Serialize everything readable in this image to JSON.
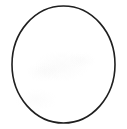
{
  "figure": {
    "caption": "A single thin dark circle outline centered on a plain white background",
    "background_color": "#ffffff",
    "canvas": {
      "width": 127,
      "height": 129
    },
    "shapes": [
      {
        "name": "circle-outline",
        "kind": "ellipse",
        "center_x": 63.5,
        "center_y": 64.5,
        "radius_x": 51.5,
        "radius_y": 58.5,
        "stroke_color": "#1f1f1f",
        "stroke_width": 1.6,
        "fill": "none",
        "bounds": {
          "left": 12,
          "top": 6,
          "right": 115,
          "bottom": 123
        }
      }
    ]
  }
}
